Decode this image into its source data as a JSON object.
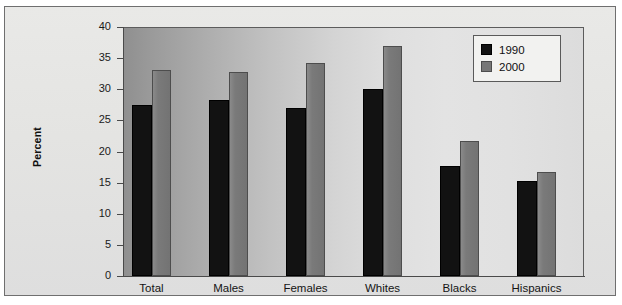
{
  "chart_data": {
    "type": "bar",
    "title": "",
    "subtitle": "",
    "xlabel": "",
    "ylabel": "Percent",
    "categories": [
      "Total",
      "Males",
      "Females",
      "Whites",
      "Blacks",
      "Hispanics"
    ],
    "series": [
      {
        "name": "1990",
        "color": "#121212",
        "values": [
          27.4,
          28.3,
          27.0,
          30.0,
          17.7,
          15.3
        ]
      },
      {
        "name": "2000",
        "color": "#777777",
        "values": [
          33.1,
          32.7,
          34.2,
          37.0,
          21.7,
          16.7
        ]
      }
    ],
    "ylim": [
      0,
      40
    ],
    "ytick_step": 5,
    "yticks": [
      "40",
      "35",
      "30",
      "25",
      "20",
      "15",
      "10",
      "5",
      "0"
    ],
    "grid": false,
    "legend_position": "top-right",
    "legend_entries": [
      "1990",
      "2000"
    ],
    "annotations": []
  },
  "axes": {
    "y_axis_title": "Percent"
  },
  "legend": {
    "items": [
      {
        "label": "1990",
        "swatch": "black-square-icon"
      },
      {
        "label": "2000",
        "swatch": "gray-square-icon"
      }
    ]
  }
}
